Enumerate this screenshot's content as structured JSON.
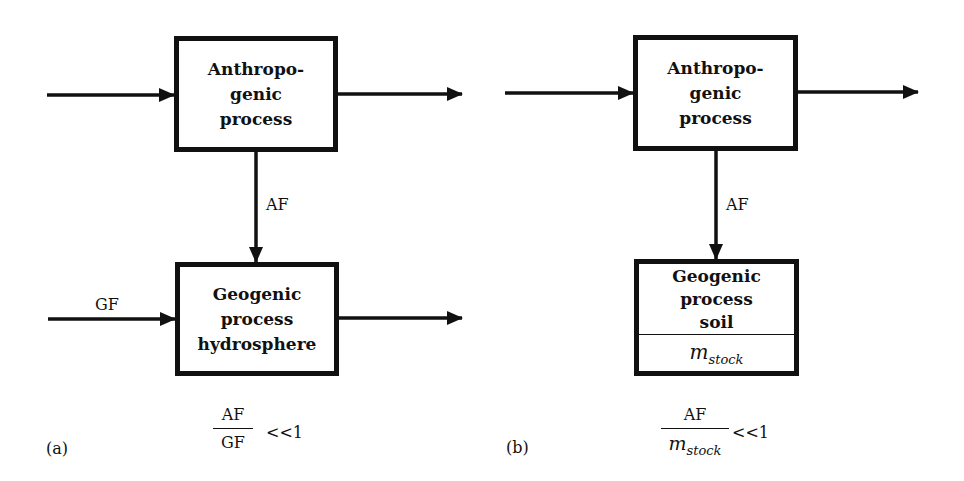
{
  "panels": [
    {
      "id": "a",
      "label": "(a)",
      "top_box": {
        "title": "Anthropo-\ngenic\nprocess"
      },
      "bottom_box": {
        "title": "Geogenic\nprocess\nhydrosphere"
      },
      "flow_anthropogenic": "AF",
      "flow_geogenic": "GF",
      "ratio": {
        "numerator": "AF",
        "denominator": "GF",
        "relation": "<<1"
      }
    },
    {
      "id": "b",
      "label": "(b)",
      "top_box": {
        "title": "Anthropo-\ngenic\nprocess"
      },
      "bottom_box": {
        "title": "Geogenic\nprocess\nsoil",
        "stock_symbol": "m",
        "stock_subscript": "stock"
      },
      "flow_anthropogenic": "AF",
      "ratio": {
        "numerator": "AF",
        "denominator_symbol": "m",
        "denominator_subscript": "stock",
        "relation": "<<1"
      }
    }
  ],
  "colors": {
    "stroke": "#111111",
    "background": "#ffffff"
  }
}
